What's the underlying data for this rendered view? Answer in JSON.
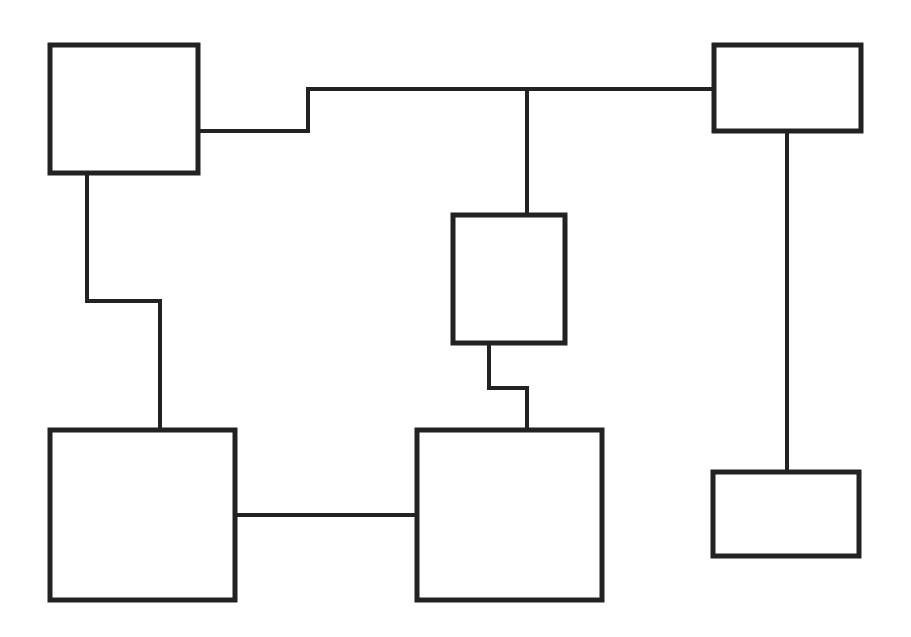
{
  "diagram": {
    "type": "block-diagram",
    "background": "#ffffff",
    "stroke_color": "#222222",
    "nodes": [
      {
        "id": "box-top-left",
        "label": "",
        "x": 50,
        "y": 45,
        "w": 148,
        "h": 128
      },
      {
        "id": "box-top-right",
        "label": "",
        "x": 714,
        "y": 45,
        "w": 147,
        "h": 86
      },
      {
        "id": "box-center",
        "label": "",
        "x": 453,
        "y": 215,
        "w": 112,
        "h": 128
      },
      {
        "id": "box-bottom-left",
        "label": "",
        "x": 50,
        "y": 430,
        "w": 185,
        "h": 170
      },
      {
        "id": "box-bottom-center",
        "label": "",
        "x": 417,
        "y": 430,
        "w": 185,
        "h": 170
      },
      {
        "id": "box-bottom-right",
        "label": "",
        "x": 713,
        "y": 472,
        "w": 146,
        "h": 84
      }
    ],
    "edges": [
      {
        "id": "edge-topleft-topright",
        "from": "box-top-left",
        "to": "box-top-right",
        "points": "198,131 308,131 308,89 714,89"
      },
      {
        "id": "edge-bus-center",
        "from": "edge-topleft-topright",
        "to": "box-center",
        "points": "527,89 527,215"
      },
      {
        "id": "edge-topright-bottomright",
        "from": "box-top-right",
        "to": "box-bottom-right",
        "points": "787,131 787,472"
      },
      {
        "id": "edge-topleft-bottomleft",
        "from": "box-top-left",
        "to": "box-bottom-left",
        "points": "87,173 87,301 160,301 160,430"
      },
      {
        "id": "edge-center-bottomcenter",
        "from": "box-center",
        "to": "box-bottom-center",
        "points": "489,343 489,388 527,388 527,430"
      },
      {
        "id": "edge-bottomleft-bottomcenter",
        "from": "box-bottom-left",
        "to": "box-bottom-center",
        "points": "235,515 417,515"
      }
    ]
  }
}
